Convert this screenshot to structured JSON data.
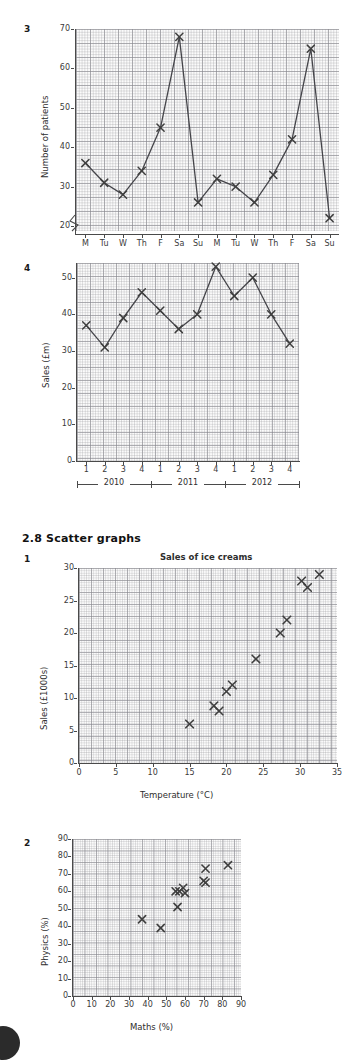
{
  "section": {
    "heading": "2.8 Scatter graphs"
  },
  "figures": {
    "fig3": {
      "number": "3",
      "ylabel": "Number of patients",
      "yticks": [
        "20",
        "30",
        "40",
        "50",
        "60",
        "70"
      ],
      "xticks": [
        "M",
        "Tu",
        "W",
        "Th",
        "F",
        "Sa",
        "Su",
        "M",
        "Tu",
        "W",
        "Th",
        "F",
        "Sa",
        "Su"
      ],
      "chart_data": {
        "type": "line",
        "title": "",
        "xlabel": "",
        "ylabel": "Number of patients",
        "categories": [
          "M",
          "Tu",
          "W",
          "Th",
          "F",
          "Sa",
          "Su",
          "M",
          "Tu",
          "W",
          "Th",
          "F",
          "Sa",
          "Su"
        ],
        "values": [
          36,
          31,
          28,
          34,
          45,
          68,
          26,
          32,
          30,
          26,
          33,
          42,
          65,
          22
        ],
        "ylim": [
          18,
          70
        ],
        "axis_break": true,
        "grid": true,
        "marker": "cross",
        "legend": "none"
      }
    },
    "fig4": {
      "number": "4",
      "ylabel": "Sales (£m)",
      "yticks": [
        "0",
        "10",
        "20",
        "30",
        "40",
        "50"
      ],
      "xticks": [
        "1",
        "2",
        "3",
        "4",
        "1",
        "2",
        "3",
        "4",
        "1",
        "2",
        "3",
        "4"
      ],
      "years": [
        "2010",
        "2011",
        "2012"
      ],
      "chart_data": {
        "type": "line",
        "title": "",
        "xlabel": "",
        "ylabel": "Sales (£m)",
        "categories": [
          "1",
          "2",
          "3",
          "4",
          "1",
          "2",
          "3",
          "4",
          "1",
          "2",
          "3",
          "4"
        ],
        "group_labels": [
          "2010",
          "2011",
          "2012"
        ],
        "values": [
          37,
          31,
          39,
          46,
          41,
          36,
          40,
          53,
          45,
          50,
          40,
          32
        ],
        "ylim": [
          0,
          54
        ],
        "grid": true,
        "marker": "cross",
        "legend": "none"
      }
    },
    "fig5": {
      "number": "1",
      "title": "Sales of ice creams",
      "ylabel": "Sales (£1000s)",
      "xlabel": "Temperature (°C)",
      "yticks": [
        "0",
        "5",
        "10",
        "15",
        "20",
        "25",
        "30"
      ],
      "xticks": [
        "0",
        "5",
        "10",
        "15",
        "20",
        "25",
        "30",
        "35"
      ],
      "chart_data": {
        "type": "scatter",
        "title": "Sales of ice creams",
        "xlabel": "Temperature (°C)",
        "ylabel": "Sales (£1000s)",
        "xlim": [
          0,
          35
        ],
        "ylim": [
          0,
          30
        ],
        "grid": true,
        "marker": "cross",
        "legend": "none",
        "points": [
          {
            "x": 15.0,
            "y": 6.0
          },
          {
            "x": 18.3,
            "y": 8.8
          },
          {
            "x": 19.0,
            "y": 8.0
          },
          {
            "x": 20.0,
            "y": 11.0
          },
          {
            "x": 20.8,
            "y": 12.0
          },
          {
            "x": 24.0,
            "y": 16.0
          },
          {
            "x": 27.3,
            "y": 20.0
          },
          {
            "x": 28.2,
            "y": 22.0
          },
          {
            "x": 30.2,
            "y": 28.0
          },
          {
            "x": 31.0,
            "y": 27.0
          },
          {
            "x": 32.6,
            "y": 29.0
          }
        ]
      }
    },
    "fig6": {
      "number": "2",
      "ylabel": "Physics (%)",
      "xlabel": "Maths (%)",
      "yticks": [
        "0",
        "10",
        "20",
        "30",
        "40",
        "50",
        "60",
        "70",
        "80",
        "90"
      ],
      "xticks": [
        "0",
        "10",
        "20",
        "30",
        "40",
        "50",
        "60",
        "70",
        "80",
        "90"
      ],
      "chart_data": {
        "type": "scatter",
        "title": "",
        "xlabel": "Maths (%)",
        "ylabel": "Physics (%)",
        "xlim": [
          0,
          90
        ],
        "ylim": [
          0,
          90
        ],
        "grid": true,
        "marker": "cross",
        "legend": "none",
        "points": [
          {
            "x": 37,
            "y": 44
          },
          {
            "x": 47,
            "y": 39
          },
          {
            "x": 55,
            "y": 60
          },
          {
            "x": 57,
            "y": 60
          },
          {
            "x": 56,
            "y": 51
          },
          {
            "x": 59,
            "y": 62
          },
          {
            "x": 60,
            "y": 59
          },
          {
            "x": 70,
            "y": 66
          },
          {
            "x": 71,
            "y": 65
          },
          {
            "x": 71,
            "y": 73
          },
          {
            "x": 83,
            "y": 75
          }
        ]
      }
    }
  },
  "colors": {
    "ink": "#3a3a3a",
    "grid_minor": "#9a9aa0",
    "grid_major": "#7a7a82",
    "plot_bg": "#fbfbfb",
    "page_marker": "#2b2b2b"
  }
}
